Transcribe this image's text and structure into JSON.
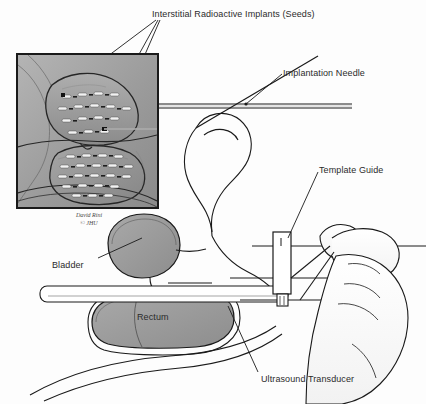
{
  "figure": {
    "background_color": "#fdfdfd",
    "line_color": "#1a1a1a"
  },
  "labels": {
    "seeds": "Interstitial Radioactive Implants (Seeds)",
    "needle": "Implantation Needle",
    "template": "Template Guide",
    "bladder": "Bladder",
    "rectum": "Rectum",
    "transducer": "Ultrasound Transducer"
  },
  "attribution": {
    "artist": "David Rini",
    "copyright": "© JHU"
  },
  "inset": {
    "name": "magnified-cross-section",
    "border_color": "#1a1a1a",
    "fill_color": "#9d9d9d",
    "seed_color": "#f2f2f2",
    "upper_cluster_rows": 4,
    "lower_cluster_rows": 5,
    "seed_total": 39
  },
  "colors": {
    "organ_fill": "#9a9a9a",
    "tissue_light": "#fbfbfb",
    "outline": "#1a1a1a",
    "seed": "#f4f4f4",
    "dash": "#2a2a2a"
  }
}
